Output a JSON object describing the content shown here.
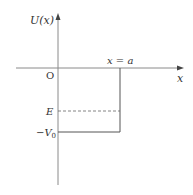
{
  "diagram": {
    "type": "potential-energy-well",
    "labels": {
      "y_axis": "U(x)",
      "x_axis": "x",
      "origin": "O",
      "wall_position": "x = a",
      "energy_level": "E",
      "well_depth": "−V",
      "well_depth_subscript": "0"
    },
    "colors": {
      "axis": "#8a8a8a",
      "line": "#555555",
      "text": "#333333",
      "background": "#ffffff"
    }
  }
}
